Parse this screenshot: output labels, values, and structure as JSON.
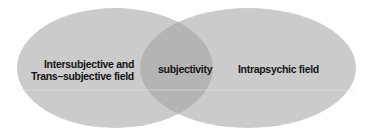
{
  "diagram": {
    "type": "venn",
    "circles": [
      {
        "id": "left",
        "label_lines": [
          "Intersubjective and",
          "Trans–subjective field"
        ]
      },
      {
        "id": "right",
        "label": "Intrapsychic field"
      }
    ],
    "intersection": {
      "label": "subjectivity"
    },
    "colors": {
      "ellipse_fill": "#cbcbcb",
      "overlap_fill": "#b4b4b4",
      "text": "#141414",
      "background": "#ffffff"
    }
  }
}
